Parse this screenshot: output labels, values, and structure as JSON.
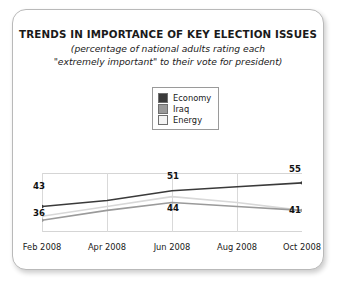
{
  "card": {
    "title": "TRENDS IN IMPORTANCE OF KEY ELECTION ISSUES",
    "subtitle_line1": "(percentage of national adults rating each",
    "subtitle_line2": "\"extremely important\" to their vote for president)"
  },
  "legend": {
    "items": [
      {
        "label": "Economy",
        "color": "#3a3a3a"
      },
      {
        "label": "Iraq",
        "color": "#9a9a9a"
      },
      {
        "label": "Energy",
        "color": "#efefef"
      }
    ]
  },
  "chart_data": {
    "type": "line",
    "title": "TRENDS IN IMPORTANCE OF KEY ELECTION ISSUES",
    "subtitle": "(percentage of national adults rating each \"extremely important\" to their vote for president)",
    "xlabel": "",
    "ylabel": "",
    "categories": [
      "Feb 2008",
      "Apr 2008",
      "Jun 2008",
      "Aug 2008",
      "Oct 2008"
    ],
    "ylim": [
      30,
      60
    ],
    "grid": "vertical",
    "legend_position": "top-center",
    "series": [
      {
        "name": "Economy",
        "color": "#3a3a3a",
        "values": [
          43,
          46,
          51,
          53,
          55
        ]
      },
      {
        "name": "Iraq",
        "color": "#9a9a9a",
        "values": [
          36,
          41,
          45,
          43,
          41
        ]
      },
      {
        "name": "Energy",
        "color": "#d8d8d8",
        "values": [
          38,
          43,
          48,
          45,
          41
        ]
      }
    ],
    "point_labels": [
      {
        "text": "43",
        "series": "Economy",
        "category": "Feb 2008",
        "x": 32,
        "y": 180
      },
      {
        "text": "36",
        "series": "Iraq",
        "category": "Feb 2008",
        "x": 32,
        "y": 207
      },
      {
        "text": "51",
        "series": "Economy",
        "category": "Jun 2008",
        "x": 166,
        "y": 170
      },
      {
        "text": "44",
        "series": "Iraq",
        "category": "Jun 2008",
        "x": 166,
        "y": 202
      },
      {
        "text": "55",
        "series": "Economy",
        "category": "Oct 2008",
        "x": 288,
        "y": 163
      },
      {
        "text": "41",
        "series": "Iraq",
        "category": "Oct 2008",
        "x": 288,
        "y": 204
      }
    ]
  }
}
